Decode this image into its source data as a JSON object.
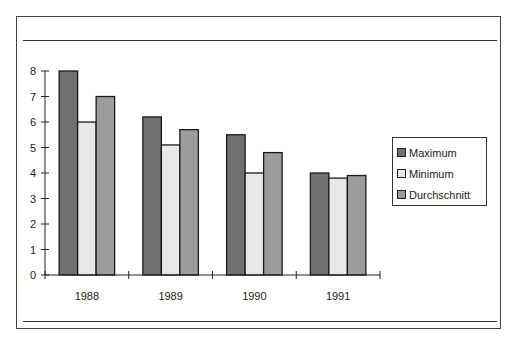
{
  "chart_data": {
    "type": "bar",
    "title": "",
    "xlabel": "",
    "ylabel": "",
    "categories": [
      "1988",
      "1989",
      "1990",
      "1991"
    ],
    "series": [
      {
        "name": "Maximum",
        "color": "#707070",
        "values": [
          8.0,
          6.2,
          5.5,
          4.0
        ]
      },
      {
        "name": "Minimum",
        "color": "#e8e8e8",
        "values": [
          6.0,
          5.1,
          4.0,
          3.8
        ]
      },
      {
        "name": "Durchschnitt",
        "color": "#9c9c9c",
        "values": [
          7.0,
          5.7,
          4.8,
          3.9
        ]
      }
    ],
    "ylim": [
      0,
      8
    ],
    "yticks": [
      0,
      1,
      2,
      3,
      4,
      5,
      6,
      7,
      8
    ],
    "grid": false,
    "legend_position": "right"
  },
  "legend": {
    "items": [
      {
        "label": "Maximum",
        "color": "#707070"
      },
      {
        "label": "Minimum",
        "color": "#e8e8e8"
      },
      {
        "label": "Durchschnitt",
        "color": "#9c9c9c"
      }
    ]
  }
}
